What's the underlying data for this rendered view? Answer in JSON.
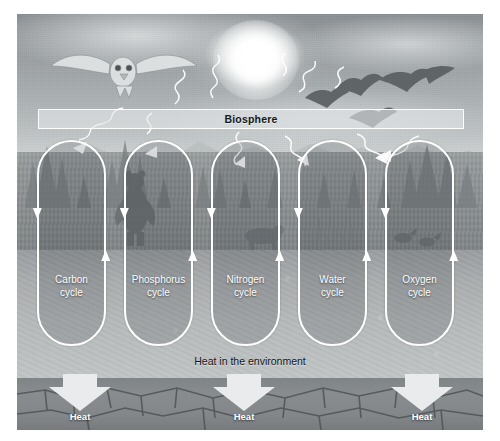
{
  "figure": {
    "banner": {
      "label": "Biosphere"
    },
    "heat_environment_label": "Heat in the environment",
    "cycles": [
      {
        "id": "carbon",
        "line1": "Carbon",
        "line2": "cycle"
      },
      {
        "id": "phosphorus",
        "line1": "Phosphorus",
        "line2": "cycle"
      },
      {
        "id": "nitrogen",
        "line1": "Nitrogen",
        "line2": "cycle"
      },
      {
        "id": "water",
        "line1": "Water",
        "line2": "cycle"
      },
      {
        "id": "oxygen",
        "line1": "Oxygen",
        "line2": "cycle"
      }
    ],
    "heat_arrows": [
      {
        "label": "Heat"
      },
      {
        "label": "Heat"
      },
      {
        "label": "Heat"
      }
    ],
    "scene_elements": [
      {
        "name": "sun",
        "description": "sun"
      },
      {
        "name": "owl",
        "description": "flying owl"
      },
      {
        "name": "geese",
        "description": "flock of flying geese"
      },
      {
        "name": "bear",
        "description": "standing bear"
      },
      {
        "name": "conifer-trees",
        "description": "conifer trees"
      },
      {
        "name": "mountains",
        "description": "distant mountain range"
      },
      {
        "name": "bedrock",
        "description": "cracked bedrock layer"
      }
    ],
    "colors": {
      "outline": "#ffffff",
      "banner_text": "#14181a",
      "heat_text": "#ffffff",
      "environment_text": "#121518",
      "arrow_fill": "#e9ebec"
    }
  }
}
